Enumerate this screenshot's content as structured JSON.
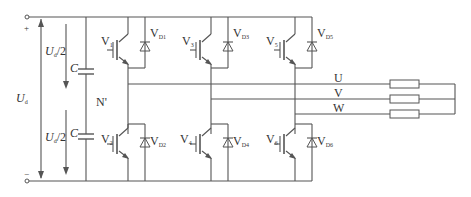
{
  "diagram": {
    "dc_source": {
      "label": "U",
      "label_sub": "d",
      "plus": "+",
      "minus": "−"
    },
    "half_voltage_top": {
      "label": "U",
      "label_sub": "d",
      "suffix": "/2"
    },
    "half_voltage_bottom": {
      "label": "U",
      "label_sub": "d",
      "suffix": "/2"
    },
    "capacitor_top": "C",
    "capacitor_bottom": "C",
    "neutral_point": "N'",
    "switches": [
      {
        "label": "V",
        "sub": "1"
      },
      {
        "label": "V",
        "sub": "3"
      },
      {
        "label": "V",
        "sub": "5"
      },
      {
        "label": "V",
        "sub": "2"
      },
      {
        "label": "V",
        "sub": "4"
      },
      {
        "label": "V",
        "sub": "6"
      }
    ],
    "diodes": [
      {
        "label": "V",
        "sub": "D1"
      },
      {
        "label": "V",
        "sub": "D3"
      },
      {
        "label": "V",
        "sub": "D5"
      },
      {
        "label": "V",
        "sub": "D2"
      },
      {
        "label": "V",
        "sub": "D4"
      },
      {
        "label": "V",
        "sub": "D6"
      }
    ],
    "phases": [
      "U",
      "V",
      "W"
    ],
    "colors": {
      "wire": "#555555",
      "text": "#333333",
      "background": "#ffffff"
    }
  }
}
